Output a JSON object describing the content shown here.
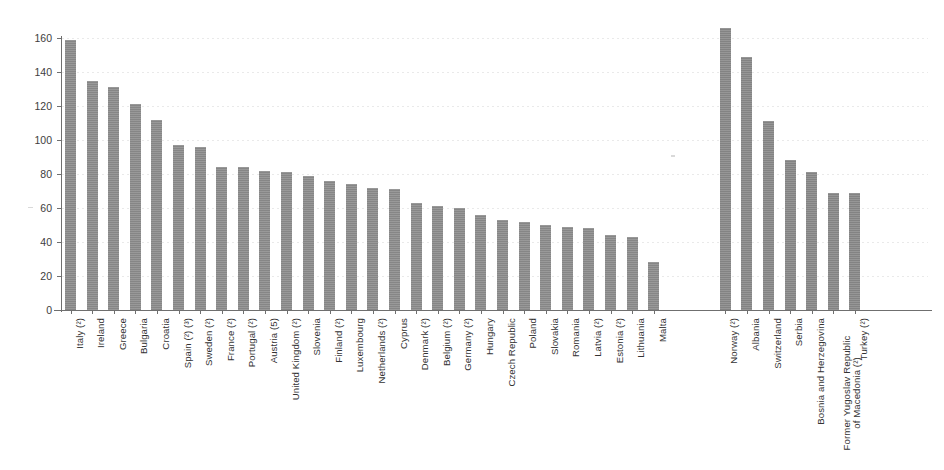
{
  "chart_data": {
    "type": "bar",
    "title": "",
    "subtitle": "",
    "xlabel": "",
    "ylabel": "",
    "ylim": [
      0,
      160
    ],
    "ytick_values": [
      0,
      20,
      40,
      60,
      80,
      100,
      120,
      140,
      160
    ],
    "ytick_labels": [
      "0",
      "20",
      "40",
      "60",
      "80",
      "100",
      "120",
      "140",
      "160"
    ],
    "grid": true,
    "grid_axis": "y",
    "legend": false,
    "bar_color": "#8d8d8d",
    "group_gap_after_category": "Malta",
    "categories": [
      "Italy (²)",
      "Ireland",
      "Greece",
      "Bulgaria",
      "Croatia",
      "Spain (²) (³)",
      "Sweden (²)",
      "France (²)",
      "Portugal (²)",
      "Austria (5)",
      "United Kingdom (²)",
      "Slovenia",
      "Finland (²)",
      "Luxembourg",
      "Netherlands (²)",
      "Cyprus",
      "Denmark (²)",
      "Belgium (²)",
      "Germany (²)",
      "Hungary",
      "Czech Republic",
      "Poland",
      "Slovakia",
      "Romania",
      "Latvia (²)",
      "Estonia (²)",
      "Lithuania",
      "Malta",
      "Norway (²)",
      "Albania",
      "Switzerland",
      "Serbia",
      "Bosnia and Herzegovina",
      "Former Yugoslav Republic of Macedonia (²)",
      "Turkey (²)"
    ],
    "values": [
      159,
      135,
      131,
      121,
      112,
      97,
      96,
      84,
      84,
      82,
      81,
      79,
      76,
      74,
      72,
      71,
      63,
      61,
      60,
      56,
      53,
      52,
      50,
      49,
      48,
      44,
      43,
      28,
      166,
      149,
      111,
      88,
      81,
      69,
      69
    ],
    "series": [
      {
        "name": "Value",
        "values": [
          159,
          135,
          131,
          121,
          112,
          97,
          96,
          84,
          84,
          82,
          81,
          79,
          76,
          74,
          72,
          71,
          63,
          61,
          60,
          56,
          53,
          52,
          50,
          49,
          48,
          44,
          43,
          28,
          166,
          149,
          111,
          88,
          81,
          69,
          69
        ]
      }
    ],
    "label_lines": {
      "Former Yugoslav Republic of Macedonia (²)": [
        "Former Yugoslav Republic",
        "of Macedonia (²)"
      ]
    }
  },
  "axis": {
    "y_axis_name": "y-axis",
    "x_axis_name": "x-axis"
  }
}
